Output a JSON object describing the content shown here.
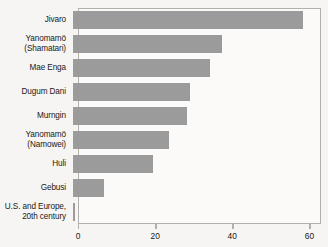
{
  "chart_data": {
    "type": "bar",
    "orientation": "horizontal",
    "title": "",
    "xlabel": "",
    "ylabel": "",
    "xlim": [
      0,
      63
    ],
    "xticks": [
      0,
      20,
      40,
      60
    ],
    "xtick_labels": [
      "0",
      "20",
      "40",
      "60"
    ],
    "grid": false,
    "legend": false,
    "bar_color": "#9b9b9b",
    "frame_color": "#b2b0ad",
    "background_color": "#f6f5f3",
    "plot_background_color": "#fbfaf9",
    "categories": [
      "Jivaro",
      "Yanomamö\n(Shamatari)",
      "Mae Enga",
      "Dugum Dani",
      "Murngin",
      "Yanomamö\n(Namowei)",
      "Huli",
      "Gebusi",
      "U.S. and Europe,\n20th century"
    ],
    "values": [
      59.5,
      38.7,
      35.6,
      30.4,
      29.6,
      24.9,
      20.8,
      8.0,
      0.6
    ],
    "series": [
      {
        "name": "percentage-of-deaths-in-warfare",
        "values": [
          59.5,
          38.7,
          35.6,
          30.4,
          29.6,
          24.9,
          20.8,
          8.0,
          0.6
        ]
      }
    ]
  }
}
